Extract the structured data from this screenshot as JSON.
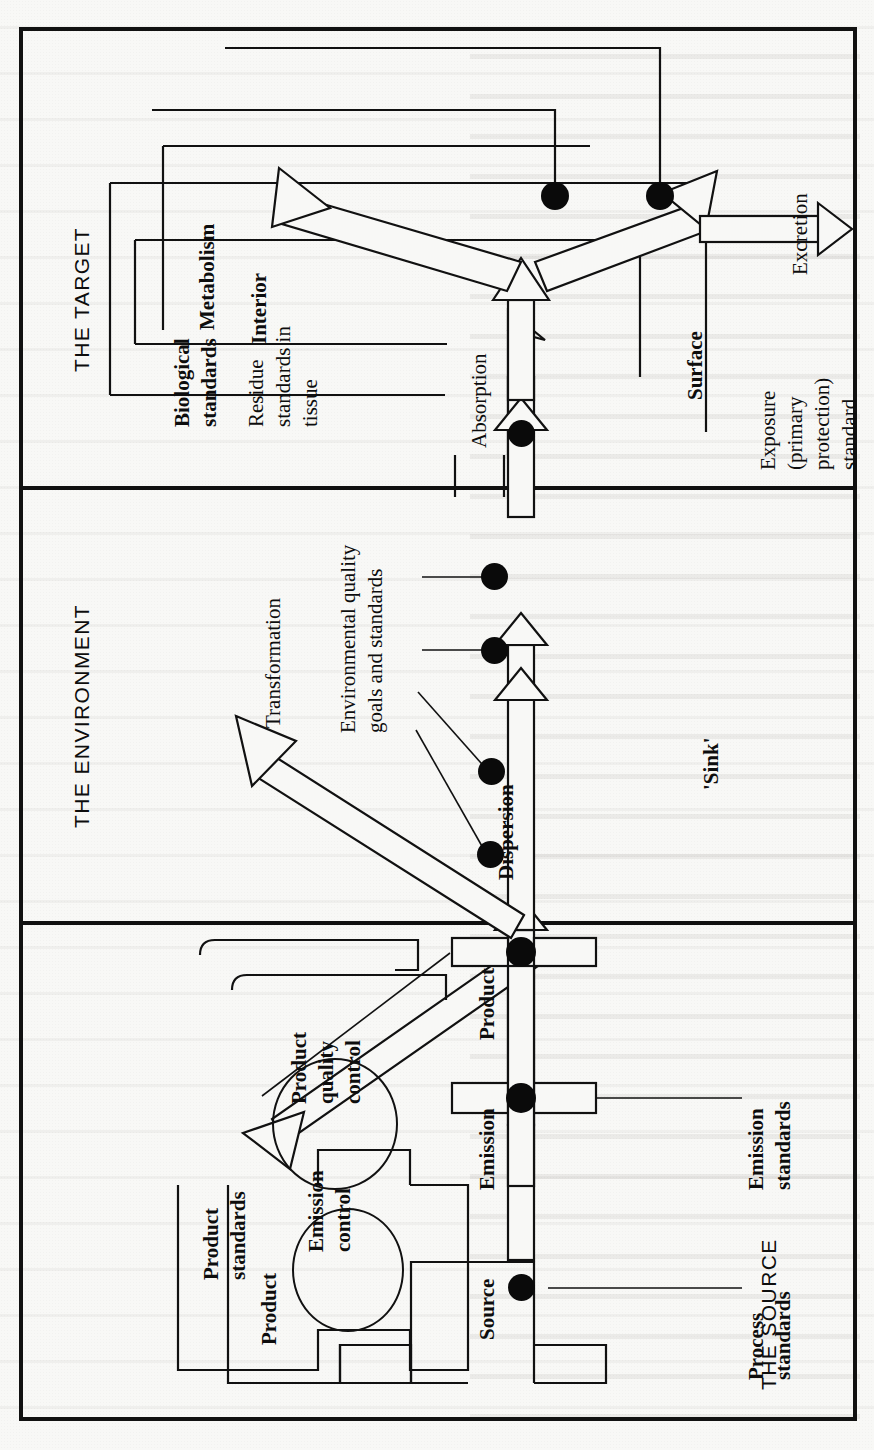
{
  "figure": {
    "orientation": "rotated-90-ccw",
    "sections": [
      {
        "id": "target",
        "title": "THE TARGET"
      },
      {
        "id": "environment",
        "title": "THE ENVIRONMENT"
      },
      {
        "id": "source",
        "title": "THE SOURCE"
      }
    ],
    "target": {
      "boxes": [
        {
          "name": "metabolism",
          "label": "Metabolism"
        },
        {
          "name": "interior",
          "label": "Interior"
        },
        {
          "name": "surface",
          "label": "Surface"
        }
      ],
      "flow_labels": [
        {
          "name": "absorption",
          "label": "Absorption"
        },
        {
          "name": "excretion",
          "label": "Excretion"
        }
      ],
      "standards": [
        {
          "name": "biological-standards",
          "label": "Biological\nstandards",
          "line1": "Biological",
          "line2": "standards"
        },
        {
          "name": "residue-standards",
          "label": "Residue standards in tissue",
          "line1": "Residue",
          "line2": "standards in",
          "line3": "tissue"
        },
        {
          "name": "exposure-standard",
          "label": "Exposure (primary protection) standard",
          "line1": "Exposure",
          "line2": "(primary",
          "line3": "protection)",
          "line4": "standard"
        }
      ]
    },
    "environment": {
      "flow_labels": [
        {
          "name": "dispersion",
          "label": "Dispersion"
        },
        {
          "name": "transformation",
          "label": "Transformation"
        },
        {
          "name": "sink",
          "label": "'Sink'"
        }
      ],
      "standards": [
        {
          "name": "environmental-quality-standards",
          "label": "Environmental quality goals and standards",
          "line1": "Environmental quality",
          "line2": "goals and standards"
        }
      ]
    },
    "source": {
      "nodes": [
        {
          "name": "source-node",
          "label": "Source"
        },
        {
          "name": "product-node",
          "label": "Product"
        },
        {
          "name": "product-box",
          "label": "Product"
        }
      ],
      "controls": [
        {
          "name": "product-quality-control",
          "label": "Product quality control",
          "line1": "Product",
          "line2": "quality",
          "line3": "control"
        },
        {
          "name": "emission-control",
          "label": "Emission control",
          "line1": "Emission",
          "line2": "control"
        }
      ],
      "flow_labels": [
        {
          "name": "emission",
          "label": "Emission"
        }
      ],
      "standards": [
        {
          "name": "product-standards",
          "label": "Product standards",
          "line1": "Product",
          "line2": "standards"
        },
        {
          "name": "emission-standards",
          "label": "Emission standards",
          "line1": "Emission",
          "line2": "standards"
        },
        {
          "name": "process-standards",
          "label": "Process standards",
          "line1": "Process",
          "line2": "standards"
        }
      ]
    },
    "colors": {
      "ink": "#111111",
      "paper": "#f8f8f6"
    }
  }
}
